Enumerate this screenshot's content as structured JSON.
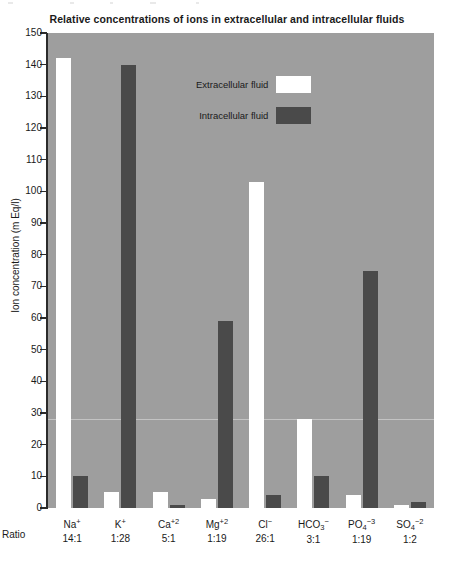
{
  "chart_data": {
    "type": "bar",
    "title": "Relative concentrations of ions in extracellular and intracellular fluids",
    "xlabel": "",
    "ylabel": "Ion concentration (m Eq/l)",
    "ylim": [
      0,
      150
    ],
    "yticks": [
      0,
      10,
      20,
      30,
      40,
      50,
      60,
      70,
      80,
      90,
      100,
      110,
      120,
      130,
      140,
      150
    ],
    "grid": true,
    "legend_position": "upper-center",
    "categories": [
      "Na",
      "K",
      "Ca",
      "Mg",
      "Cl",
      "HCO3",
      "PO4",
      "SO4"
    ],
    "category_labels": [
      {
        "base": "Na",
        "sub": "",
        "sup": "+"
      },
      {
        "base": "K",
        "sub": "",
        "sup": "+"
      },
      {
        "base": "Ca",
        "sub": "",
        "sup": "+2"
      },
      {
        "base": "Mg",
        "sub": "",
        "sup": "+2"
      },
      {
        "base": "Cl",
        "sub": "",
        "sup": "−"
      },
      {
        "base": "HCO",
        "sub": "3",
        "sup": "−"
      },
      {
        "base": "PO",
        "sub": "4",
        "sup": "−3"
      },
      {
        "base": "SO",
        "sub": "4",
        "sup": "−2"
      }
    ],
    "ratios": [
      "14:1",
      "1:28",
      "5:1",
      "1:19",
      "26:1",
      "3:1",
      "1:19",
      "1:2"
    ],
    "series": [
      {
        "name": "Extracellular fluid",
        "color": "#ffffff",
        "values": [
          142,
          5,
          5,
          3,
          103,
          28,
          4,
          1
        ]
      },
      {
        "name": "Intracellular fluid",
        "color": "#4a4a4a",
        "values": [
          10,
          140,
          1,
          59,
          4,
          10,
          75,
          2
        ]
      }
    ]
  },
  "chart": {
    "title": "Relative concentrations of ions in extracellular and intracellular fluids",
    "y_axis_title": "Ion concentration (m Eq/l)",
    "ratio_row_label": "Ratio",
    "y_tick_labels": [
      "150",
      "140",
      "130",
      "120",
      "110",
      "100",
      "90",
      "80",
      "70",
      "60",
      "50",
      "40",
      "30",
      "20",
      "10",
      "0"
    ]
  },
  "legend": {
    "items": [
      {
        "label": "Extracellular fluid",
        "swatch": "white-swatch"
      },
      {
        "label": "Intracellular fluid",
        "swatch": "dark-gray-swatch"
      }
    ]
  },
  "colors": {
    "plot_background": "#9e9e9e",
    "extracellular": "#ffffff",
    "intracellular": "#4a4a4a",
    "axis": "#2b2b2b",
    "gridline": "#c9c9c9"
  }
}
